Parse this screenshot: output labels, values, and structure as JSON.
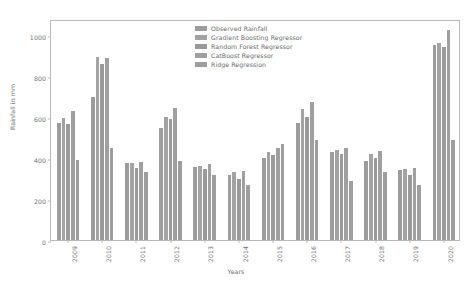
{
  "chart_data": {
    "type": "bar",
    "title": "",
    "xlabel": "Years",
    "ylabel": "Rainfall in mm",
    "ylim": [
      0,
      1080
    ],
    "yticks": [
      0,
      200,
      400,
      600,
      800,
      1000
    ],
    "ytick_labels": [
      "0",
      "200",
      "400",
      "600",
      "800",
      "1000"
    ],
    "grid": false,
    "legend_position": "upper center",
    "categories": [
      "2009",
      "2010",
      "2011",
      "2012",
      "2013",
      "2014",
      "2015",
      "2016",
      "2017",
      "2018",
      "2019",
      "2020"
    ],
    "series": [
      {
        "name": "Observed Rainfall",
        "color": "#9c9c9c",
        "values": [
          570,
          700,
          375,
          545,
          355,
          320,
          400,
          570,
          430,
          385,
          340,
          955
        ]
      },
      {
        "name": "Gradient Boosting Regressor",
        "color": "#a3a3a3",
        "values": [
          595,
          895,
          375,
          600,
          360,
          330,
          430,
          640,
          440,
          420,
          345,
          965
        ]
      },
      {
        "name": "Random Forest Regressor",
        "color": "#9a9a9a",
        "values": [
          565,
          860,
          350,
          590,
          345,
          300,
          415,
          600,
          420,
          400,
          320,
          945
        ]
      },
      {
        "name": "CatBoost Regressor",
        "color": "#a0a0a0",
        "values": [
          630,
          890,
          380,
          645,
          370,
          335,
          450,
          675,
          450,
          435,
          350,
          1025
        ]
      },
      {
        "name": "Ridge Regression",
        "color": "#9e9e9e",
        "values": [
          390,
          450,
          330,
          385,
          320,
          270,
          470,
          490,
          290,
          330,
          270,
          490
        ]
      }
    ]
  }
}
